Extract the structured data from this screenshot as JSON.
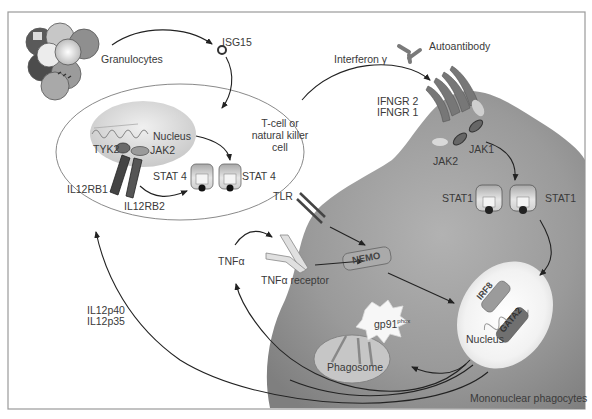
{
  "labels": {
    "granulocytes": "Granulocytes",
    "isg15": "ISG15",
    "interferon_gamma": "Interferon γ",
    "autoantibody": "Autoantibody",
    "ifngr2": "IFNGR 2",
    "ifngr1": "IFNGR 1",
    "tcell_line1": "T-cell or",
    "tcell_line2": "natural killer",
    "tcell_line3": "cell",
    "nucleus_tcell": "Nucleus",
    "tyk2": "TYK2",
    "jak2_tcell": "JAK2",
    "stat4_left": "STAT 4",
    "stat4_right": "STAT 4",
    "il12rb1": "IL12RB1",
    "il12rb2": "IL12RB2",
    "jak2_mono": "JAK2",
    "jak1": "JAK1",
    "stat1_left": "STAT1",
    "stat1_right": "STAT1",
    "tlr": "TLR",
    "tnfa": "TNFα",
    "tnfa_receptor": "TNFα receptor",
    "nemo": "NEMO",
    "irf8": "IRF8",
    "gata2": "GATA2",
    "nucleus_mono": "Nucleus",
    "gp91_base": "gp91",
    "gp91_sup": "phox",
    "phagosome": "Phagosome",
    "il12p40": "IL12p40",
    "il12p35": "IL12p35",
    "mononuclear_phagocytes": "Mononuclear phagocytes"
  },
  "colors": {
    "frame": "#9a9a9a",
    "cell_fill": "#8e8e8e",
    "cell_fill_light": "#b5b5b5",
    "arrow": "#222222",
    "text": "#3a3a3a",
    "outline": "#8a8a8a"
  }
}
